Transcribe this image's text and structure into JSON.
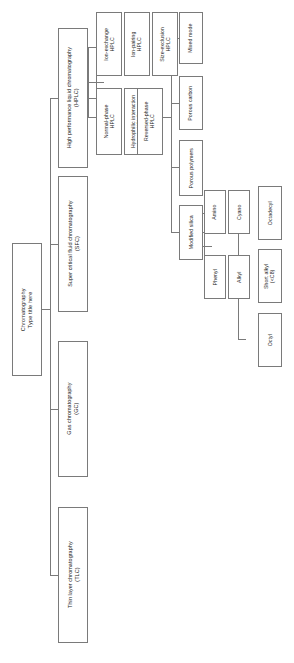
{
  "diagram": {
    "orientation": "rotated-90",
    "border_color": "#7a7a7a",
    "background_color": "#ffffff",
    "text_color": "#1a1a1a",
    "root": {
      "line1": "Chromatography",
      "line2": "Type title here"
    },
    "level1": [
      {
        "id": "hplc",
        "line1": "High performance liquid chromatography",
        "line2": "(HPLC)"
      },
      {
        "id": "sfc",
        "line1": "Super critical fluid chromatography",
        "line2": "(SFC)"
      },
      {
        "id": "gc",
        "line1": "Gas chromatography",
        "line2": "(GC)"
      },
      {
        "id": "tlc",
        "line1": "Thin layer chromatography",
        "line2": "(TLC)"
      }
    ],
    "hplc_modes_top": [
      {
        "id": "iec",
        "line1": "Ion-exchange",
        "line2": "HPLC"
      },
      {
        "id": "ipc",
        "line1": "Ion-pairing",
        "line2": "HPLC"
      },
      {
        "id": "sec",
        "line1": "Size-exclusion",
        "line2": "HPLC"
      }
    ],
    "hplc_modes_bottom": [
      {
        "id": "npc",
        "line1": "Normal-phase",
        "line2": "HPLC"
      },
      {
        "id": "hilic",
        "line1": "Hydrophilic interaction",
        "line2": "HPLC"
      },
      {
        "id": "rpc",
        "line1": "Reversed-phase",
        "line2": "HPLC"
      }
    ],
    "stationary_phases": [
      {
        "id": "mixed",
        "line1": "Mixed mode",
        "line2": ""
      },
      {
        "id": "carbon",
        "line1": "Porous carbon",
        "line2": ""
      },
      {
        "id": "polymers",
        "line1": "Porous polymers",
        "line2": ""
      },
      {
        "id": "silica",
        "line1": "Modified silica",
        "line2": ""
      }
    ],
    "silica_children": [
      {
        "id": "amino",
        "line1": "Amino",
        "line2": ""
      },
      {
        "id": "cyano",
        "line1": "Cyano",
        "line2": ""
      },
      {
        "id": "phenyl",
        "line1": "Phenyl",
        "line2": ""
      },
      {
        "id": "alkyl",
        "line1": "Alkyl",
        "line2": ""
      }
    ],
    "alkyl_children": [
      {
        "id": "octadecyl",
        "line1": "Octadecyl",
        "line2": ""
      },
      {
        "id": "shortalkyl",
        "line1": "Short alkyl",
        "line2": "(<C8)"
      },
      {
        "id": "octyl",
        "line1": "Octyl",
        "line2": ""
      }
    ]
  }
}
